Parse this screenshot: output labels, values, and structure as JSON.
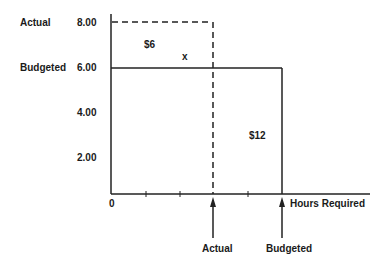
{
  "diagram": {
    "y_axis": {
      "ticks": [
        {
          "label": "8.00",
          "side_label": "Actual"
        },
        {
          "label": "6.00",
          "side_label": "Budgeted"
        },
        {
          "label": "4.00"
        },
        {
          "label": "2.00"
        }
      ]
    },
    "x_axis": {
      "origin_label": "0",
      "title": "Hours Required",
      "markers": [
        {
          "label": "Actual"
        },
        {
          "label": "Budgeted"
        }
      ]
    },
    "regions": {
      "price_variance": "$6",
      "overlap_marker": "x",
      "quantity_variance": "$12"
    }
  }
}
